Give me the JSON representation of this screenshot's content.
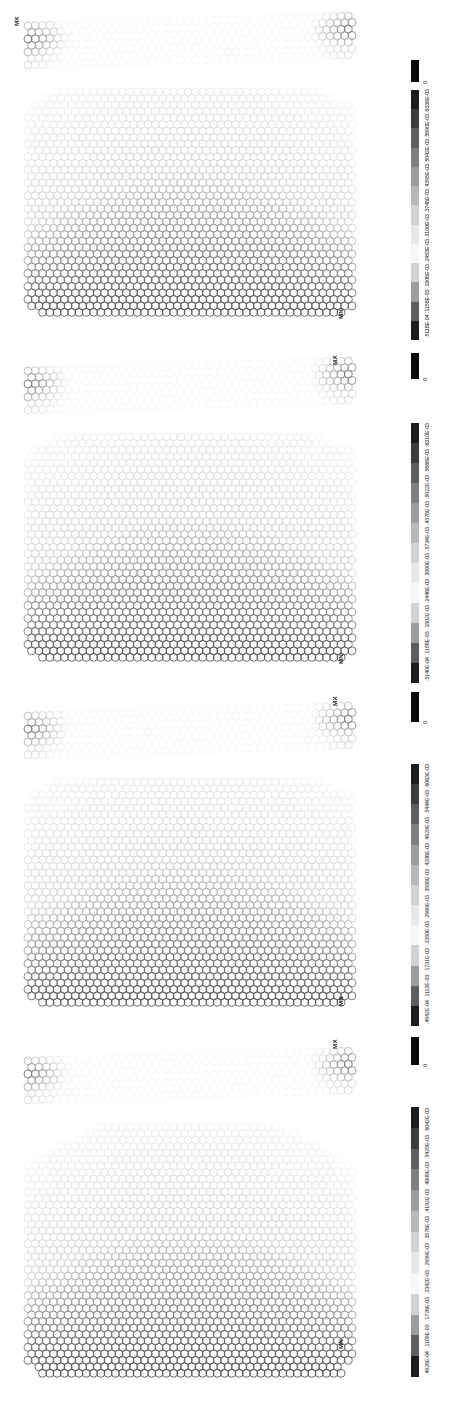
{
  "figure": {
    "panel_count": 4,
    "orientation": "rotated-90",
    "background_color": "#ffffff"
  },
  "legend_palette": [
    "#1c1c1c",
    "#3d3d3d",
    "#5e5e5e",
    "#7f7f7f",
    "#9d9d9d",
    "#b8b8b8",
    "#d2d2d2",
    "#e8e8e8",
    "#f7f7f7"
  ],
  "zero_swatch_color": "#0a0a0a",
  "zero_label": "0",
  "node_labels": {
    "max": "MX",
    "min": "MN"
  },
  "panels": [
    {
      "id": "panel-1",
      "max_label": "MX",
      "min_label": "MN",
      "max_position": "top-left",
      "min_position": "bottom-right",
      "legend": {
        "zero": "0",
        "ticks": [
          ".5118E-04",
          ".1158E-03",
          ".1806E-03",
          ".2453E-03",
          ".3100E-03",
          ".3748E-03",
          ".4395E-03",
          ".5042E-03",
          ".5690E-03",
          ".6338E-03"
        ]
      }
    },
    {
      "id": "panel-2",
      "max_label": "MX",
      "min_label": "MN",
      "max_position": "top-right",
      "min_position": "bottom-right",
      "legend": {
        "zero": "0",
        "ticks": [
          ".5140E-04",
          ".1158E-03",
          ".1802E-03",
          ".2446E-03",
          ".3090E-03",
          ".3734E-03",
          ".4378E-03",
          ".5022E-03",
          ".5666E-03",
          ".6310E-03"
        ]
      }
    },
    {
      "id": "panel-3",
      "max_label": "MX",
      "min_label": "MN",
      "max_position": "top-right",
      "min_position": "bottom-right",
      "legend": {
        "zero": "0",
        "ticks": [
          ".4942E-04",
          ".1113E-03",
          ".1731E-03",
          ".2350E-03",
          ".2969E-03",
          ".3588E-03",
          ".4206E-03",
          ".4825E-03",
          ".5444E-03",
          ".6063E-03"
        ]
      }
    },
    {
      "id": "panel-4",
      "max_label": "MX",
      "min_label": "MN",
      "max_position": "top-right",
      "min_position": "bottom-right",
      "legend": {
        "zero": "0",
        "ticks": [
          ".4926E-04",
          ".1109E-03",
          ".1726E-03",
          ".2342E-03",
          ".2959E-03",
          ".3576E-03",
          ".4192E-03",
          ".4809E-03",
          ".5425E-03",
          ".6042E-03"
        ]
      }
    }
  ],
  "chart_data": {
    "type": "heatmap",
    "subtitle": "Hexagonally meshed arch / dome cross-section with thin upper strip",
    "xlabel": "",
    "ylabel": "",
    "grid": false,
    "legend_position": "right",
    "colormap": "grayscale-9-band",
    "panels": [
      {
        "name": "panel-1",
        "vmin": 0.0,
        "vmax": 0.0006338,
        "band_edges": [
          0.0,
          5.118e-05,
          0.0001158,
          0.0001806,
          0.0002453,
          0.00031,
          0.0003748,
          0.0004395,
          0.0005042,
          0.000569,
          0.0006338
        ],
        "unit": "m",
        "extrema": {
          "MX": 0.0006338,
          "MN": 0.0
        }
      },
      {
        "name": "panel-2",
        "vmin": 0.0,
        "vmax": 0.000631,
        "band_edges": [
          0.0,
          5.14e-05,
          0.0001158,
          0.0001802,
          0.0002446,
          0.000309,
          0.0003734,
          0.0004378,
          0.0005022,
          0.0005666,
          0.000631
        ],
        "unit": "m",
        "extrema": {
          "MX": 0.000631,
          "MN": 0.0
        }
      },
      {
        "name": "panel-3",
        "vmin": 0.0,
        "vmax": 0.0006063,
        "band_edges": [
          0.0,
          4.942e-05,
          0.0001113,
          0.0001731,
          0.000235,
          0.0002969,
          0.0003588,
          0.0004206,
          0.0004825,
          0.0005444,
          0.0006063
        ],
        "unit": "m",
        "extrema": {
          "MX": 0.0006063,
          "MN": 0.0
        }
      },
      {
        "name": "panel-4",
        "vmin": 0.0,
        "vmax": 0.0006042,
        "band_edges": [
          0.0,
          4.926e-05,
          0.0001109,
          0.0001726,
          0.0002342,
          0.0002959,
          0.0003576,
          0.0004192,
          0.0004809,
          0.0005425,
          0.0006042
        ],
        "unit": "m",
        "extrema": {
          "MX": 0.0006042,
          "MN": 0.0
        }
      }
    ]
  }
}
